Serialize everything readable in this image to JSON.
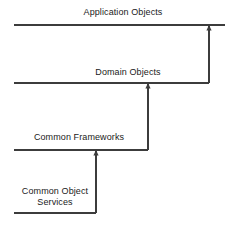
{
  "diagram": {
    "type": "layered-architecture",
    "orientation": "bottom-up",
    "background_color": "#ffffff",
    "line_color": "#3c3c3c",
    "text_color": "#1a1a1a",
    "canvas": {
      "width": 234,
      "height": 226
    },
    "layers": [
      {
        "id": "application-objects",
        "label": "Application Objects",
        "label_center_x": 123,
        "label_top_y": 7,
        "baseline_y": 25,
        "baseline_x_start": 14,
        "baseline_x_end": 225
      },
      {
        "id": "domain-objects",
        "label": "Domain Objects",
        "label_center_x": 128,
        "label_top_y": 67,
        "baseline_y": 83,
        "baseline_x_start": 14,
        "baseline_x_end": 209
      },
      {
        "id": "common-frameworks",
        "label": "Common Frameworks",
        "label_center_x": 79,
        "label_top_y": 132,
        "baseline_y": 150,
        "baseline_x_start": 14,
        "baseline_x_end": 148
      },
      {
        "id": "common-object-services",
        "label": "Common Object\nServices",
        "label_center_x": 55,
        "label_top_y": 186,
        "baseline_y": 213,
        "baseline_x_start": 14,
        "baseline_x_end": 96
      }
    ],
    "connectors": [
      {
        "id": "domain-to-application",
        "from_layer": "domain-objects",
        "to_layer": "application-objects",
        "x": 209,
        "y_from": 83,
        "y_to": 25,
        "arrowhead": "up"
      },
      {
        "id": "frameworks-to-domain",
        "from_layer": "common-frameworks",
        "to_layer": "domain-objects",
        "x": 148,
        "y_from": 150,
        "y_to": 83,
        "arrowhead": "up"
      },
      {
        "id": "services-to-frameworks",
        "from_layer": "common-object-services",
        "to_layer": "common-frameworks",
        "x": 96,
        "y_from": 213,
        "y_to": 150,
        "arrowhead": "up"
      }
    ]
  }
}
